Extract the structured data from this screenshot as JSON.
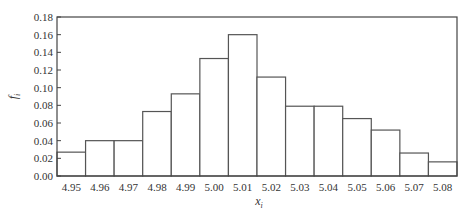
{
  "chart_data": {
    "type": "bar",
    "subtype": "histogram",
    "title": "",
    "xlabel": "x_i",
    "ylabel": "f_i",
    "categories": [
      "4.95",
      "4.96",
      "4.97",
      "4.98",
      "4.99",
      "5.00",
      "5.01",
      "5.02",
      "5.03",
      "5.04",
      "5.05",
      "5.06",
      "5.07",
      "5.08"
    ],
    "values": [
      0.027,
      0.04,
      0.04,
      0.073,
      0.093,
      0.133,
      0.16,
      0.112,
      0.079,
      0.079,
      0.065,
      0.052,
      0.026,
      0.016
    ],
    "ylim": [
      0,
      0.18
    ],
    "yticks": [
      "0.00",
      "0.02",
      "0.04",
      "0.06",
      "0.08",
      "0.10",
      "0.12",
      "0.14",
      "0.16",
      "0.18"
    ],
    "grid": false,
    "legend": null,
    "colors": {
      "bar_fill": "#ffffff",
      "bar_edge": "#555555",
      "frame": "#444444"
    }
  }
}
